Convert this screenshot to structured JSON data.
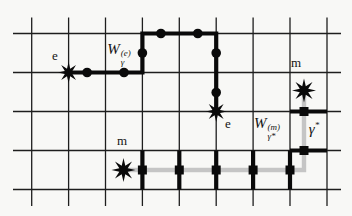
{
  "diagram": {
    "background": "#f8f8f6",
    "grid": {
      "color": "#1e1e1e",
      "width": 1.3,
      "verticals_x": [
        31.7,
        68.6,
        105.5,
        142.4,
        179.3,
        216.2,
        253.1,
        290,
        327
      ],
      "vertical_extent": [
        17.5,
        206
      ],
      "horizontals_y": [
        33.5,
        72.5,
        111.5,
        150.5,
        189.5
      ],
      "horizontal_extent": [
        13,
        341
      ]
    },
    "electric_path": {
      "description": "electric Wilson line on lattice edges between two e anyons",
      "color": "#0a0a0a",
      "width": 4.2,
      "points": [
        [
          68.6,
          72.5
        ],
        [
          142.4,
          72.5
        ],
        [
          142.4,
          33.5
        ],
        [
          216.2,
          33.5
        ],
        [
          216.2,
          111.5
        ]
      ],
      "dots": [
        [
          87.1,
          72.5
        ],
        [
          124.0,
          72.5
        ],
        [
          142.4,
          53.0
        ],
        [
          160.9,
          33.5
        ],
        [
          197.8,
          33.5
        ],
        [
          216.2,
          53.0
        ],
        [
          216.2,
          92.5
        ]
      ],
      "dot_radius": 4.8
    },
    "magnetic_path": {
      "description": "magnetic string on dual lattice between two m anyons",
      "color": "#c5c5c5",
      "width": 4.4,
      "points": [
        [
          123.5,
          170
        ],
        [
          304,
          170
        ],
        [
          304,
          92
        ]
      ],
      "squares": [
        [
          142.4,
          170
        ],
        [
          179.3,
          170
        ],
        [
          216.2,
          170
        ],
        [
          253.1,
          170
        ],
        [
          290,
          170
        ],
        [
          304,
          150.5
        ],
        [
          304,
          111.5
        ]
      ],
      "square_size": 9,
      "square_color": "#0a0a0a",
      "crossed_edges": [
        [
          142.4,
          150.5,
          142.4,
          189.5
        ],
        [
          179.3,
          150.5,
          179.3,
          189.5
        ],
        [
          216.2,
          150.5,
          216.2,
          189.5
        ],
        [
          253.1,
          150.5,
          253.1,
          189.5
        ],
        [
          290.0,
          150.5,
          290.0,
          189.5
        ],
        [
          290.0,
          150.5,
          327.0,
          150.5
        ],
        [
          290.0,
          111.5,
          327.0,
          111.5
        ]
      ],
      "crossed_edge_color": "#0a0a0a",
      "crossed_edge_width": 4.2
    },
    "stars": [
      {
        "kind": "e",
        "cx": 68.6,
        "cy": 72.5,
        "outer": 10.5,
        "inner": 4.1,
        "points": 8,
        "color": "#0a0a0a"
      },
      {
        "kind": "e",
        "cx": 216.2,
        "cy": 111.5,
        "outer": 10.5,
        "inner": 4.1,
        "points": 8,
        "color": "#0a0a0a"
      },
      {
        "kind": "m",
        "cx": 123.5,
        "cy": 170.0,
        "outer": 12.0,
        "inner": 4.6,
        "points": 8,
        "color": "#0a0a0a"
      },
      {
        "kind": "m",
        "cx": 304.0,
        "cy": 90.5,
        "outer": 12.0,
        "inner": 4.6,
        "points": 8,
        "color": "#0a0a0a"
      }
    ]
  },
  "labels": {
    "e_left": {
      "text": "e",
      "x": 55,
      "y": 55
    },
    "e_right": {
      "text": "e",
      "x": 228,
      "y": 122.5
    },
    "m_bottom": {
      "text": "m",
      "x": 122,
      "y": 139.5
    },
    "m_top": {
      "text": "m",
      "x": 296,
      "y": 62
    },
    "wilson_electric": {
      "base": "W",
      "sup": "(e)",
      "sub": "γ",
      "x": 119,
      "y": 53.5
    },
    "wilson_magnetic": {
      "base": "W",
      "sup": "(m)",
      "sub": "γ*",
      "x": 267,
      "y": 128
    },
    "gamma_star": {
      "base": "γ",
      "sup": "*",
      "x": 314,
      "y": 128.5
    }
  }
}
